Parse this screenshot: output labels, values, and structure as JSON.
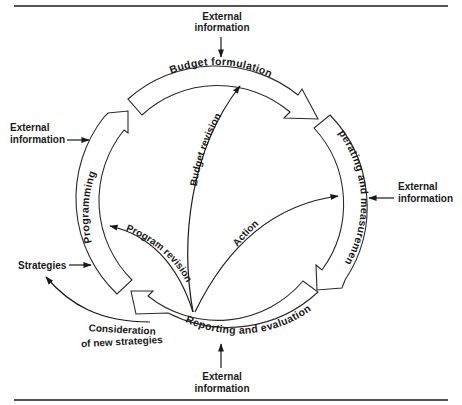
{
  "diagram": {
    "type": "cycle",
    "stages": [
      {
        "id": "budget",
        "label": "Budget formulation"
      },
      {
        "id": "operating",
        "label": "Operating and measurement"
      },
      {
        "id": "reporting",
        "label": "Reporting and evaluation"
      },
      {
        "id": "programming",
        "label": "Programming"
      }
    ],
    "internal_flows": [
      {
        "label": "Budget revision",
        "from": "reporting",
        "to": "budget"
      },
      {
        "label": "Program revision",
        "from": "reporting",
        "to": "programming"
      },
      {
        "label": "Action",
        "from": "reporting",
        "to": "operating"
      }
    ],
    "external_inputs": {
      "top": {
        "line1": "External",
        "line2": "information"
      },
      "left": {
        "line1": "External",
        "line2": "information"
      },
      "right": {
        "line1": "External",
        "line2": "information"
      },
      "bottom": {
        "line1": "External",
        "line2": "information"
      }
    },
    "strategies": {
      "label": "Strategies"
    },
    "consideration": {
      "line1": "Consideration",
      "line2": "of new strategies"
    }
  }
}
